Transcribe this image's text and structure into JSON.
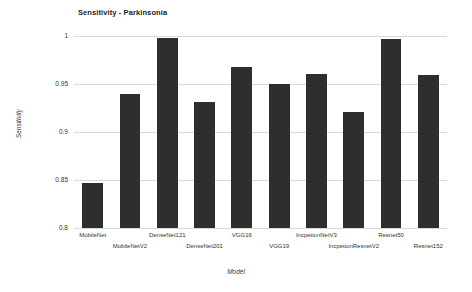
{
  "chart_data": {
    "type": "bar",
    "title": "Sensitivity - Parkinsonia",
    "xlabel": "Model",
    "ylabel": "Sensitivity",
    "categories": [
      "MobileNet",
      "MobileNetV2",
      "DenseNet121",
      "DenseNet201",
      "VGG16",
      "VGG19",
      "IncpetionNetV3",
      "IncpetionResnetV2",
      "Resnet50",
      "Resnet152"
    ],
    "values": [
      0.847,
      0.94,
      0.998,
      0.931,
      0.968,
      0.95,
      0.96,
      0.921,
      0.997,
      0.959
    ],
    "ylim": [
      0.8,
      1.0
    ],
    "yticks": [
      "0.8",
      "0.85",
      "0.9",
      "0.95",
      "1"
    ],
    "ytick_values": [
      0.8,
      0.85,
      0.9,
      0.95,
      1.0
    ],
    "grid": true,
    "legend": "none",
    "bar_color": "#2e2e2e",
    "grid_color": "#d9d9d9",
    "background_color": "#ffffff"
  }
}
